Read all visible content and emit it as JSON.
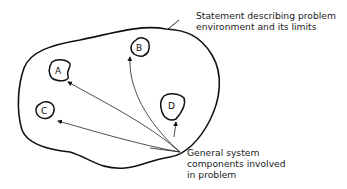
{
  "diagram": {
    "environment_label": {
      "line1": "Statement describing problem",
      "line2": "environment and its limits"
    },
    "components_label": {
      "line1": "General system",
      "line2": "components involved",
      "line3": "in problem"
    },
    "components": [
      {
        "id": "A",
        "label": "A"
      },
      {
        "id": "B",
        "label": "B"
      },
      {
        "id": "C",
        "label": "C"
      },
      {
        "id": "D",
        "label": "D"
      }
    ],
    "colors": {
      "line": "#111111",
      "background": "#ffffff"
    }
  }
}
